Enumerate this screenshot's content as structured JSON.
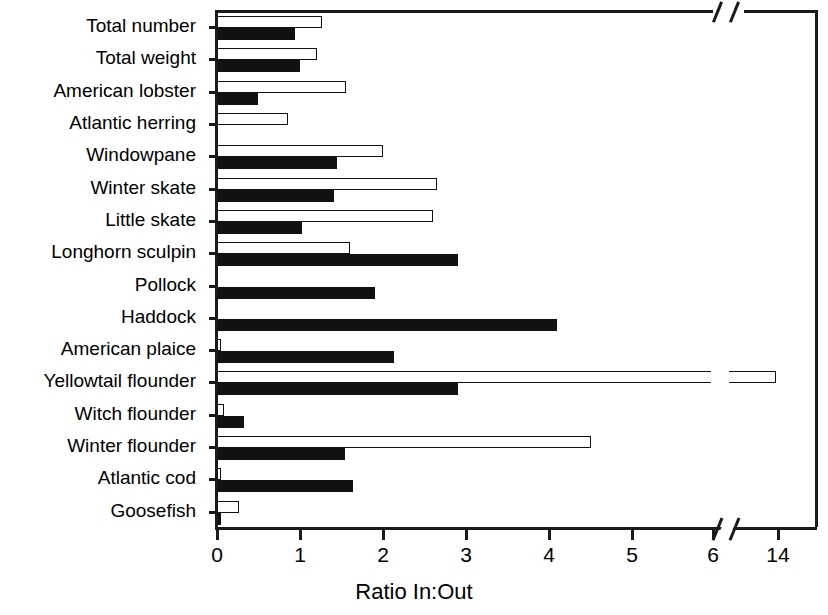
{
  "chart_data": {
    "type": "bar",
    "orientation": "horizontal",
    "title": "",
    "xlabel": "Ratio In:Out",
    "ylabel": "",
    "xlim": [
      0,
      6.8
    ],
    "grid": false,
    "axis_break": {
      "after": 6,
      "resume_label": "14"
    },
    "xticks": [
      "0",
      "1",
      "2",
      "3",
      "4",
      "5",
      "6",
      "14"
    ],
    "legend": [],
    "categories": [
      "Total number",
      "Total weight",
      "American lobster",
      "Atlantic herring",
      "Windowpane",
      "Winter skate",
      "Little skate",
      "Longhorn sculpin",
      "Pollock",
      "Haddock",
      "American plaice",
      "Yellowtail flounder",
      "Witch flounder",
      "Winter flounder",
      "Atlantic cod",
      "Goosefish"
    ],
    "series": [
      {
        "name": "open-bar",
        "style": "open",
        "values": [
          1.27,
          1.2,
          1.56,
          0.85,
          2.0,
          2.65,
          2.6,
          1.6,
          0.0,
          0.0,
          0.05,
          13.8,
          0.08,
          4.5,
          0.05,
          0.27
        ]
      },
      {
        "name": "filled-bar",
        "style": "filled",
        "values": [
          0.94,
          1.0,
          0.49,
          0.0,
          1.45,
          1.41,
          1.02,
          2.9,
          1.9,
          4.1,
          2.13,
          2.9,
          0.33,
          1.54,
          1.64,
          0.05
        ]
      }
    ]
  },
  "axis": {
    "x_title": "Ratio In:Out"
  }
}
